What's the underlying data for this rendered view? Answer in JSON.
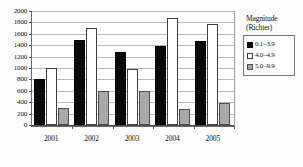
{
  "chart_data": {
    "type": "bar",
    "title": "",
    "xlabel": "",
    "ylabel": "",
    "categories": [
      "2001",
      "2002",
      "2003",
      "2004",
      "2005"
    ],
    "series": [
      {
        "name": "0.1–3.9",
        "color": "#0a0a0a",
        "values": [
          800,
          1500,
          1280,
          1390,
          1480
        ]
      },
      {
        "name": "4.0–4.9",
        "color": "#ffffff",
        "values": [
          1000,
          1700,
          980,
          1880,
          1780
        ]
      },
      {
        "name": "5.0–9.9",
        "color": "#a8a8a8",
        "values": [
          300,
          600,
          590,
          280,
          380
        ]
      }
    ],
    "ylim": [
      0,
      2000
    ],
    "ytick_step": 200,
    "yticks": [
      0,
      200,
      400,
      600,
      800,
      1000,
      1200,
      1400,
      1600,
      1800,
      2000
    ],
    "ytick_labels": [
      "0",
      "200",
      "400",
      "600",
      "800",
      "1000",
      "1200",
      "1400",
      "1600",
      "1800",
      "2000"
    ],
    "grid": true,
    "grid_axis": "y",
    "legend_position": "right"
  },
  "legend": {
    "title_lines": [
      "Magnitude",
      "(Richter)"
    ],
    "entries": [
      {
        "label": "0.1–3.9"
      },
      {
        "label": "4.0–4.9"
      },
      {
        "label": "5.0–9.9"
      }
    ]
  }
}
